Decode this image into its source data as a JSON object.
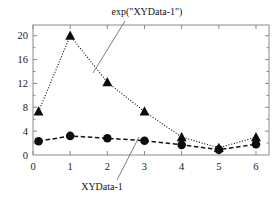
{
  "chart_data": {
    "type": "line",
    "title": "",
    "xlabel": "",
    "ylabel": "",
    "xlim": [
      0,
      6.35
    ],
    "ylim": [
      0,
      21.8
    ],
    "xticks": [
      0,
      1,
      2,
      3,
      4,
      5,
      6
    ],
    "yticks": [
      0,
      4,
      8,
      12,
      16,
      20
    ],
    "xtick_labels": [
      "0",
      "1",
      "2",
      "3",
      "4",
      "5",
      "6"
    ],
    "ytick_labels": [
      "0",
      "4",
      "8",
      "12",
      "16",
      "20"
    ],
    "grid": false,
    "legend": "none",
    "frame": "box",
    "tick_direction": "in",
    "minor_ticks_y": true,
    "series": [
      {
        "name": "exp(\"XYData-1\")",
        "marker": "triangle",
        "linestyle": "dotted",
        "color": "#0d0d0d",
        "x": [
          0.15,
          1,
          2,
          3,
          4,
          5,
          6
        ],
        "values": [
          7.3,
          20.0,
          12.2,
          7.3,
          3.0,
          1.2,
          3.0
        ]
      },
      {
        "name": "XYData-1",
        "marker": "circle",
        "linestyle": "dashed",
        "color": "#141414",
        "x": [
          0.15,
          1,
          2,
          3,
          4,
          5,
          6
        ],
        "values": [
          2.3,
          3.2,
          2.8,
          2.4,
          1.7,
          0.9,
          1.8
        ]
      }
    ],
    "annotations": [
      {
        "text": "exp(\"XYData-1\")",
        "label_x": 147,
        "label_y": 15,
        "leader_from": [
          125,
          21
        ],
        "leader_to": [
          93,
          73
        ],
        "points_to_series": "exp(\"XYData-1\")"
      },
      {
        "text": "XYData-1",
        "label_x": 102,
        "label_y": 190,
        "leader_from": [
          117,
          180
        ],
        "leader_to": [
          139,
          137
        ],
        "points_to_series": "XYData-1"
      }
    ]
  }
}
